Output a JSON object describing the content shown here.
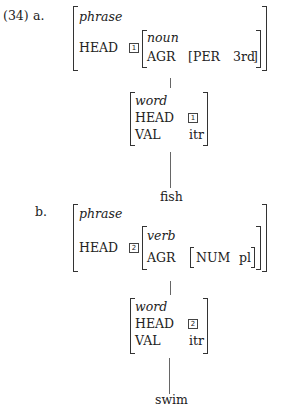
{
  "example": {
    "number": "(34)",
    "a": {
      "label": "a.",
      "mother": {
        "type": "phrase",
        "head_feature": "HEAD",
        "tag": "1",
        "head_value": {
          "type": "noun",
          "agr_feature": "AGR",
          "agr_value": {
            "feature": "PER",
            "value": "3rd"
          }
        }
      },
      "daughter": {
        "type": "word",
        "head_feature": "HEAD",
        "head_tag": "1",
        "val_feature": "VAL",
        "val_value": "itr"
      },
      "word": "fish"
    },
    "b": {
      "label": "b.",
      "mother": {
        "type": "phrase",
        "head_feature": "HEAD",
        "tag": "2",
        "head_value": {
          "type": "verb",
          "agr_feature": "AGR",
          "agr_value": {
            "feature": "NUM",
            "value": "pl"
          }
        }
      },
      "daughter": {
        "type": "word",
        "head_feature": "HEAD",
        "head_tag": "2",
        "val_feature": "VAL",
        "val_value": "itr"
      },
      "word": "swim"
    }
  }
}
